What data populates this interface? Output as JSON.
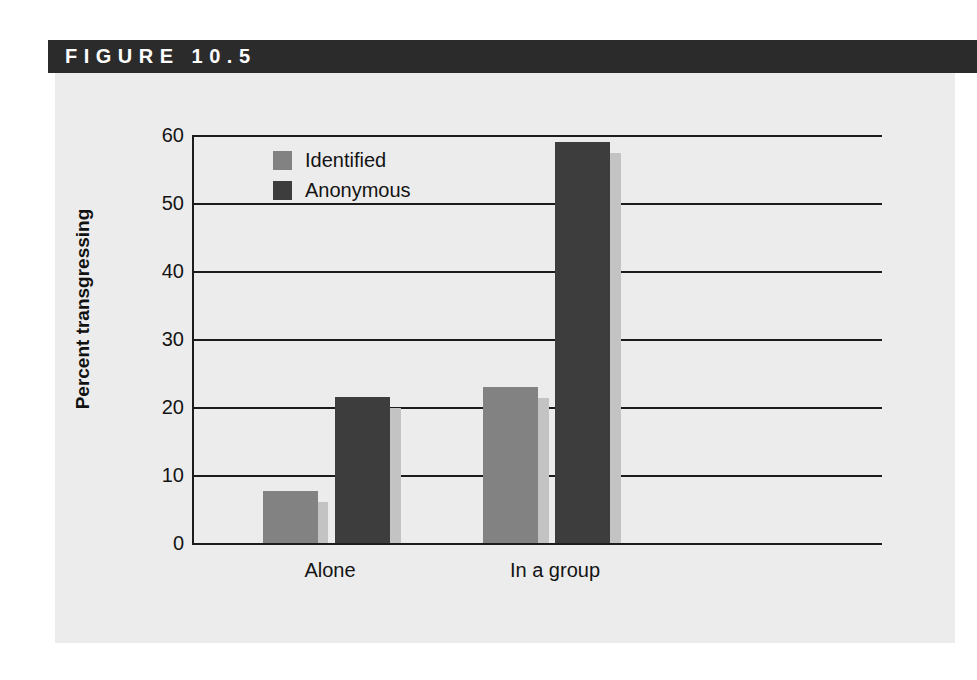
{
  "figure": {
    "header_label": "FIGURE 10.5",
    "header_bg": "#2b2b2b",
    "panel_bg": "#ececec"
  },
  "chart_data": {
    "type": "bar",
    "title": "",
    "xlabel": "",
    "ylabel": "Percent transgressing",
    "categories": [
      "Alone",
      "In a group"
    ],
    "series": [
      {
        "name": "Identified",
        "color": "#828282",
        "values": [
          7.7,
          23
        ]
      },
      {
        "name": "Anonymous",
        "color": "#3d3d3d",
        "values": [
          21.5,
          59
        ]
      }
    ],
    "ylim": [
      0,
      60
    ],
    "yticks": [
      0,
      10,
      20,
      30,
      40,
      50,
      60
    ],
    "ytick_labels": [
      "0",
      "10",
      "20",
      "30",
      "40",
      "50",
      "60"
    ],
    "grid": true,
    "legend_position": "upper-left-inside"
  },
  "legend": {
    "items": [
      {
        "label": "Identified",
        "color": "#828282"
      },
      {
        "label": "Anonymous",
        "color": "#3d3d3d"
      }
    ]
  },
  "axis": {
    "tick_0": "0",
    "tick_10": "10",
    "tick_20": "20",
    "tick_30": "30",
    "tick_40": "40",
    "tick_50": "50",
    "tick_60": "60",
    "ylabel": "Percent transgressing",
    "cat_alone": "Alone",
    "cat_group": "In a group"
  },
  "bars": {
    "identified_alone": {
      "label": "Identified - Alone",
      "value": 7.7
    },
    "anonymous_alone": {
      "label": "Anonymous - Alone",
      "value": 21.5
    },
    "identified_group": {
      "label": "Identified - In a group",
      "value": 23
    },
    "anonymous_group": {
      "label": "Anonymous - In a group",
      "value": 59
    }
  }
}
